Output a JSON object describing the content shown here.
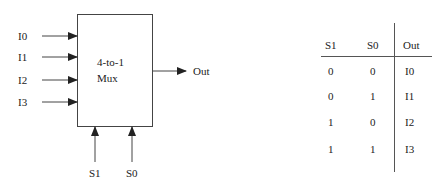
{
  "mux": {
    "label_line1": "4-to-1",
    "label_line2": "Mux",
    "inputs": [
      "I0",
      "I1",
      "I2",
      "I3"
    ],
    "selects": [
      "S1",
      "S0"
    ],
    "output": "Out"
  },
  "truth_table": {
    "headers": [
      "S1",
      "S0",
      "Out"
    ],
    "rows": [
      [
        "0",
        "0",
        "I0"
      ],
      [
        "0",
        "1",
        "I1"
      ],
      [
        "1",
        "0",
        "I2"
      ],
      [
        "1",
        "1",
        "I3"
      ]
    ]
  }
}
